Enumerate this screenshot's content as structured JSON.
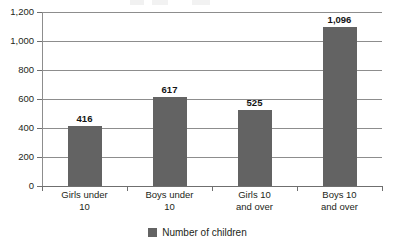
{
  "chart_data": {
    "type": "bar",
    "title": "",
    "subtitle": "",
    "xlabel": "",
    "ylabel": "",
    "categories": [
      "Girls under\n10",
      "Boys under\n10",
      "Girls 10\nand over",
      "Boys 10\nand over"
    ],
    "category_lines": [
      [
        "Girls under",
        "10"
      ],
      [
        "Boys under",
        "10"
      ],
      [
        "Girls 10",
        "and over"
      ],
      [
        "Boys 10",
        "and over"
      ]
    ],
    "values": [
      416,
      617,
      525,
      1096
    ],
    "value_labels": [
      "416",
      "617",
      "525",
      "1,096"
    ],
    "series": [
      {
        "name": "Number of children",
        "values": [
          416,
          617,
          525,
          1096
        ],
        "color": "#636363"
      }
    ],
    "ylim": [
      0,
      1200
    ],
    "ytick_values": [
      0,
      200,
      400,
      600,
      800,
      1000,
      1200
    ],
    "ytick_labels": [
      "0",
      "200",
      "400",
      "600",
      "800",
      "1,000",
      "1,200"
    ],
    "grid": true,
    "grid_axis": "y",
    "legend": {
      "position": "bottom-center",
      "entries": [
        {
          "label": "Number of children",
          "color": "#636363"
        }
      ]
    }
  },
  "legend": {
    "label": "Number of children"
  },
  "colors": {
    "bar": "#636363",
    "grid": "#8d8d8d",
    "axis": "#6f6f6f",
    "text": "#231f20",
    "background": "#ffffff"
  }
}
